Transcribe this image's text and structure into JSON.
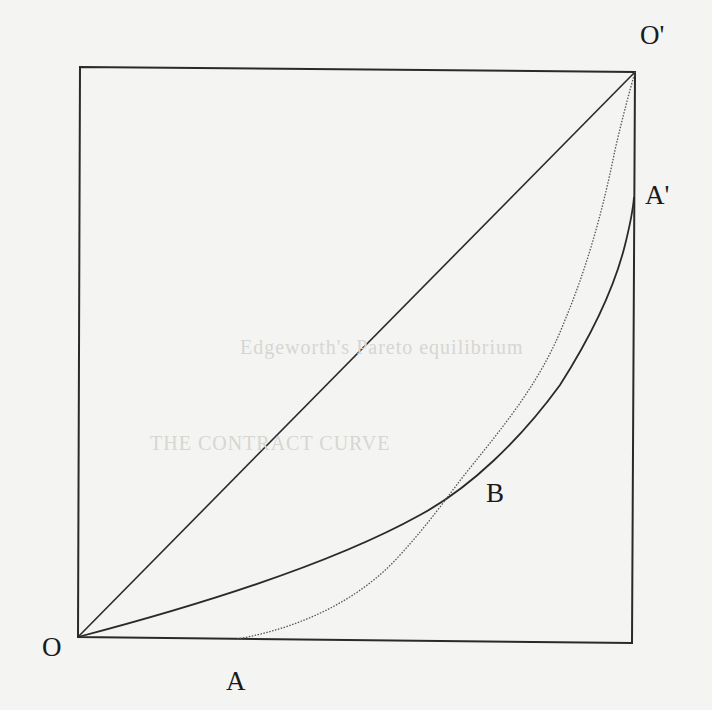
{
  "diagram": {
    "type": "edgeworth-box-contract-curve",
    "box": {
      "corners": {
        "top_left": [
          80,
          67
        ],
        "top_right": [
          635,
          72
        ],
        "bottom_right": [
          632,
          643
        ],
        "bottom_left": [
          78,
          637
        ]
      },
      "stroke": "#2a2a2a"
    },
    "points": {
      "O": {
        "label": "O",
        "x": 78,
        "y": 637,
        "label_x": 42,
        "label_y": 634
      },
      "O_prime": {
        "label": "O'",
        "x": 635,
        "y": 72,
        "label_x": 640,
        "label_y": 20
      },
      "A": {
        "label": "A",
        "x": 237,
        "y": 639,
        "label_x": 226,
        "label_y": 668
      },
      "A_prime": {
        "label": "A'",
        "x": 634,
        "y": 197,
        "label_x": 647,
        "label_y": 180
      },
      "B": {
        "label": "B",
        "x": 462,
        "y": 478,
        "label_x": 486,
        "label_y": 478
      }
    },
    "lines": {
      "diagonal": {
        "from": "O",
        "to": "O_prime",
        "style": "solid"
      },
      "curve_O_B_Aprime": {
        "style": "solid",
        "path": "M78,637 C200,605 330,565 420,515 C470,488 520,440 560,385 C595,330 615,285 625,245 C630,225 633,210 634,197"
      },
      "curve_A_B_Oprime": {
        "style": "dotted",
        "path": "M237,639 C300,628 360,600 400,555 C430,522 445,500 462,478 C500,430 540,385 565,320 C590,260 605,200 615,150 C623,115 630,90 635,72"
      }
    },
    "ghost_text": {
      "line1": "Edgeworth's Pareto equilibrium",
      "line2": "THE CONTRACT CURVE"
    }
  }
}
